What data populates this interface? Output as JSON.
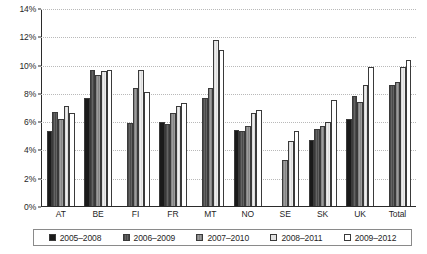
{
  "chart_data": {
    "type": "bar",
    "title": "",
    "subtitle": "",
    "xlabel": "",
    "ylabel": "",
    "ylim": [
      0,
      14
    ],
    "yunit": "%",
    "ytick_labels": [
      "0%",
      "2%",
      "4%",
      "6%",
      "8%",
      "10%",
      "12%",
      "14%"
    ],
    "ytick_values": [
      0,
      2,
      4,
      6,
      8,
      10,
      12,
      14
    ],
    "grid": true,
    "legend_position": "bottom",
    "categories": [
      "AT",
      "BE",
      "FI",
      "FR",
      "MT",
      "NO",
      "SE",
      "SK",
      "UK",
      "Total"
    ],
    "series": [
      {
        "name": "2005–2008",
        "values": [
          5.3,
          7.7,
          null,
          6.0,
          null,
          5.4,
          null,
          4.7,
          6.2,
          null
        ]
      },
      {
        "name": "2006–2009",
        "values": [
          6.7,
          9.7,
          5.9,
          5.8,
          7.7,
          5.3,
          null,
          5.5,
          7.8,
          8.6
        ]
      },
      {
        "name": "2007–2010",
        "values": [
          6.2,
          9.3,
          8.4,
          6.6,
          8.4,
          5.7,
          3.3,
          5.7,
          7.4,
          8.8
        ]
      },
      {
        "name": "2008–2011",
        "values": [
          7.1,
          9.6,
          9.7,
          7.1,
          11.8,
          6.6,
          4.6,
          6.0,
          8.6,
          9.9
        ]
      },
      {
        "name": "2009–2012",
        "values": [
          6.6,
          9.7,
          8.1,
          7.3,
          11.1,
          6.8,
          5.3,
          7.5,
          9.9,
          10.4
        ]
      }
    ]
  },
  "legend": {
    "items": [
      {
        "label": "2005–2008"
      },
      {
        "label": "2006–2009"
      },
      {
        "label": "2007–2010"
      },
      {
        "label": "2008–2011"
      },
      {
        "label": "2009–2012"
      }
    ]
  }
}
